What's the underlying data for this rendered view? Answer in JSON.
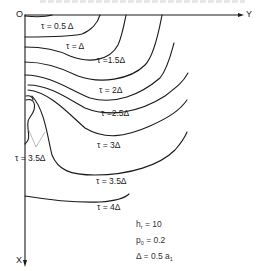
{
  "figure": {
    "axes": {
      "origin_label": "O",
      "horizontal_label": "Y",
      "vertical_label": "X"
    },
    "contours": [
      {
        "id": "t05",
        "label": "τ = 0.5 Δ"
      },
      {
        "id": "t10",
        "label": "τ = Δ"
      },
      {
        "id": "t15",
        "label": "τ =1.5Δ"
      },
      {
        "id": "t20",
        "label": "τ = 2Δ"
      },
      {
        "id": "t25",
        "label": "τ =2.5Δ"
      },
      {
        "id": "t30",
        "label": "τ = 3Δ"
      },
      {
        "id": "t35_inner",
        "label": "τ = 3.5Δ"
      },
      {
        "id": "t35",
        "label": "τ = 3.5Δ"
      },
      {
        "id": "t40",
        "label": "τ = 4Δ"
      }
    ],
    "parameters": {
      "h": {
        "symbol": "h",
        "subscript": "r",
        "value": "= 10"
      },
      "p": {
        "symbol": "p",
        "subscript": "0",
        "value": "= 0.2"
      },
      "delta": {
        "symbol": "Δ",
        "value": "= 0.5 a",
        "subscript": "1"
      }
    }
  }
}
